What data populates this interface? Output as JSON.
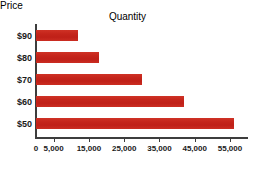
{
  "chart_data": {
    "type": "bar",
    "orientation": "horizontal",
    "title": "",
    "xlabel": "Quantity",
    "ylabel": "Price",
    "categories": [
      "$90",
      "$80",
      "$70",
      "$60",
      "$50"
    ],
    "values": [
      12000,
      18000,
      30000,
      42000,
      56000
    ],
    "series": [
      {
        "name": "Quantity demanded",
        "values": [
          12000,
          18000,
          30000,
          42000,
          56000
        ]
      }
    ],
    "xlim": [
      0,
      58000
    ],
    "xticks": [
      0,
      5000,
      15000,
      25000,
      35000,
      45000,
      55000
    ],
    "xtick_labels": [
      "0",
      "5,000",
      "15,000",
      "25,000",
      "35,000",
      "45,000",
      "55,000"
    ],
    "ytick_labels": [
      "$90",
      "$80",
      "$70",
      "$60",
      "$50"
    ],
    "grid": false,
    "legend": false,
    "bar_color": "#c8281e",
    "axis_color": "#3d3d3d",
    "text_color": "#1a1a1a",
    "background_color": "#ffffff"
  },
  "axes": {
    "y_title": "Price",
    "x_title": "Quantity"
  },
  "bars": [
    {
      "label": "$90",
      "value": 12000
    },
    {
      "label": "$80",
      "value": 18000
    },
    {
      "label": "$70",
      "value": 30000
    },
    {
      "label": "$60",
      "value": 42000
    },
    {
      "label": "$50",
      "value": 56000
    }
  ],
  "xticks": [
    {
      "value": 0,
      "label": "0"
    },
    {
      "value": 5000,
      "label": "5,000"
    },
    {
      "value": 15000,
      "label": "15,000"
    },
    {
      "value": 25000,
      "label": "25,000"
    },
    {
      "value": 35000,
      "label": "35,000"
    },
    {
      "value": 45000,
      "label": "45,000"
    },
    {
      "value": 55000,
      "label": "55,000"
    }
  ]
}
